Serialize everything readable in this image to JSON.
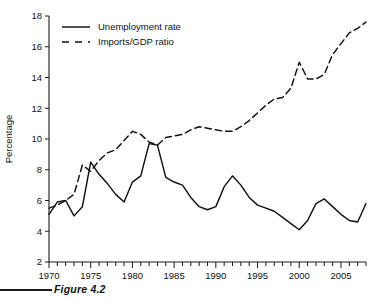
{
  "figure": {
    "caption": "Figure 4.2"
  },
  "chart_data": {
    "type": "line",
    "title": "",
    "xlabel": "",
    "ylabel": "Percentage",
    "xlim": [
      1970,
      2008
    ],
    "ylim": [
      2,
      18
    ],
    "grid": false,
    "legend_position": "top-left",
    "y_ticks": [
      2,
      4,
      6,
      8,
      10,
      12,
      14,
      16,
      18
    ],
    "y_tick_labels": [
      "2",
      "4",
      "6",
      "8",
      "10",
      "12",
      "14",
      "16",
      "18"
    ],
    "x_ticks": [
      1970,
      1975,
      1980,
      1985,
      1990,
      1995,
      2000,
      2005
    ],
    "x_tick_labels": [
      "1970",
      "1975",
      "1980",
      "1985",
      "1990",
      "1995",
      "2000",
      "2005"
    ],
    "x_minor_tick_step": 1,
    "x": [
      1970,
      1971,
      1972,
      1973,
      1974,
      1975,
      1976,
      1977,
      1978,
      1979,
      1980,
      1981,
      1982,
      1983,
      1984,
      1985,
      1986,
      1987,
      1988,
      1989,
      1990,
      1991,
      1992,
      1993,
      1994,
      1995,
      1996,
      1997,
      1998,
      1999,
      2000,
      2001,
      2002,
      2003,
      2004,
      2005,
      2006,
      2007,
      2008
    ],
    "series": [
      {
        "name": "Unemployment rate",
        "style": "solid",
        "color": "#111111",
        "values": [
          5.1,
          5.9,
          6.0,
          5.0,
          5.6,
          8.5,
          7.7,
          7.1,
          6.4,
          5.9,
          7.2,
          7.6,
          9.7,
          9.6,
          7.5,
          7.2,
          7.0,
          6.2,
          5.6,
          5.4,
          5.6,
          6.9,
          7.6,
          7.0,
          6.2,
          5.7,
          5.5,
          5.3,
          4.9,
          4.5,
          4.1,
          4.7,
          5.8,
          6.1,
          5.6,
          5.1,
          4.7,
          4.6,
          5.8
        ]
      },
      {
        "name": "Imports/GDP ratio",
        "style": "dashed",
        "color": "#111111",
        "values": [
          5.5,
          5.7,
          6.0,
          6.4,
          8.3,
          7.9,
          8.6,
          9.1,
          9.3,
          9.9,
          10.5,
          10.3,
          9.8,
          9.6,
          10.1,
          10.2,
          10.3,
          10.6,
          10.8,
          10.7,
          10.6,
          10.5,
          10.5,
          10.8,
          11.2,
          11.7,
          12.2,
          12.6,
          12.7,
          13.3,
          15.0,
          13.9,
          13.9,
          14.2,
          15.5,
          16.2,
          16.9,
          17.2,
          17.6
        ]
      }
    ]
  },
  "legend": {
    "items": [
      {
        "label": "Unemployment rate",
        "style": "solid"
      },
      {
        "label": "Imports/GDP ratio",
        "style": "dashed"
      }
    ]
  }
}
